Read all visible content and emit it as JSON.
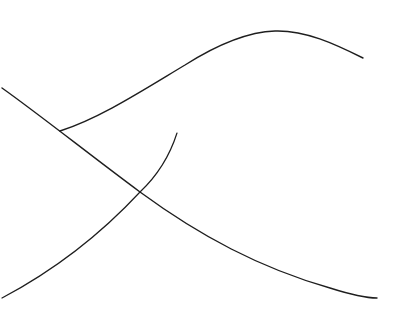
{
  "drawing": {
    "background": "#ffffff",
    "stroke_color": "#1e1e1e",
    "strokes": [
      {
        "name": "long-diagonal",
        "d": "M 2 88 C 40 115, 90 155, 140 192 C 200 236, 260 268, 330 288 C 352 295, 366 298, 377 298",
        "width": 1.4
      },
      {
        "name": "upper-wave",
        "d": "M 60 131 C 100 118, 140 92, 185 65 C 215 46, 245 32, 275 31 C 305 30, 335 44, 363 58",
        "width": 1.4
      },
      {
        "name": "lower-arc",
        "d": "M 177 133 C 170 155, 158 175, 140 192 C 100 235, 55 270, 2 298",
        "width": 1.2
      }
    ]
  }
}
